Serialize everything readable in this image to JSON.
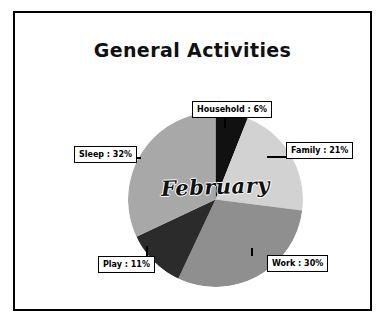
{
  "chart_data": {
    "type": "pie",
    "title": "General Activities",
    "center_label": "February",
    "categories": [
      "Household",
      "Family",
      "Work",
      "Play",
      "Sleep"
    ],
    "values": [
      6,
      21,
      30,
      11,
      32
    ],
    "unit": "%",
    "labels": [
      "Household : 6%",
      "Family : 21%",
      "Work : 30%",
      "Play : 11%",
      "Sleep : 32%"
    ],
    "colors": [
      "#111111",
      "#d2d2d2",
      "#8f8f8f",
      "#2b2b2b",
      "#a8a8a8"
    ],
    "legend": "none",
    "grid": false
  },
  "frame": {
    "border_color": "#000000",
    "background": "#ffffff"
  }
}
